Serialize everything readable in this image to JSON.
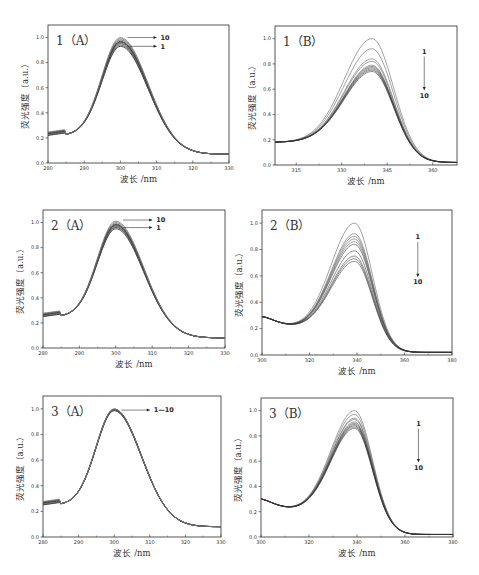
{
  "chart_data": [
    {
      "id": "1A",
      "type": "line",
      "title": "1（A）",
      "xlabel": "波长 /nm",
      "ylabel": "荧光强度（a.u.）",
      "xlim": [
        280,
        330
      ],
      "ylim": [
        0,
        1.1
      ],
      "xticks": [
        280,
        290,
        300,
        310,
        320,
        330
      ],
      "yticks": [
        0.0,
        0.2,
        0.4,
        0.6,
        0.8,
        1.0
      ],
      "peak_x": 300,
      "peaks": [
        0.93,
        0.94,
        0.95,
        0.955,
        0.96,
        0.965,
        0.97,
        0.98,
        0.99,
        1.0
      ],
      "shape": "A",
      "start_y": 0.22,
      "end_y": 0.07,
      "annotations": [
        {
          "text": "10",
          "y": 1.0
        },
        {
          "text": "1",
          "y": 0.93
        }
      ],
      "series_note": "10 curves, labeled 1 to 10",
      "box": [
        48,
        25,
        229,
        163
      ]
    },
    {
      "id": "1B",
      "type": "line",
      "title": "1（B）",
      "xlabel": "波长 /nm",
      "ylabel": "荧光强度（a.u.）",
      "xlim": [
        308,
        368
      ],
      "ylim": [
        0,
        1.1
      ],
      "xticks": [
        315,
        330,
        345,
        360
      ],
      "yticks": [
        0.0,
        0.2,
        0.4,
        0.6,
        0.8,
        1.0
      ],
      "peak_x": 340,
      "peaks": [
        1.0,
        0.92,
        0.84,
        0.82,
        0.79,
        0.78,
        0.77,
        0.76,
        0.75,
        0.74
      ],
      "shape": "B1",
      "start_y": 0.18,
      "end_y": 0.02,
      "arrow": {
        "from": "1",
        "to": "10"
      },
      "series_note": "10 curves, intensity decreases from 1 to 10",
      "box": [
        275,
        26,
        457,
        165
      ]
    },
    {
      "id": "2A",
      "type": "line",
      "title": "2（A）",
      "xlabel": "波长 /nm",
      "ylabel": "荧光强度（a.u.）",
      "xlim": [
        280,
        330
      ],
      "ylim": [
        0,
        1.1
      ],
      "xticks": [
        280,
        290,
        300,
        310,
        320,
        330
      ],
      "yticks": [
        0.0,
        0.2,
        0.4,
        0.6,
        0.8,
        1.0
      ],
      "peak_x": 300,
      "peaks": [
        0.95,
        0.96,
        0.965,
        0.97,
        0.975,
        0.98,
        0.985,
        0.99,
        1.0,
        1.01
      ],
      "shape": "A",
      "start_y": 0.25,
      "end_y": 0.08,
      "annotations": [
        {
          "text": "10",
          "y": 1.02
        },
        {
          "text": "1",
          "y": 0.96
        }
      ],
      "series_note": "10 curves, labeled 1 to 10",
      "box": [
        43,
        210,
        225,
        348
      ]
    },
    {
      "id": "2B",
      "type": "line",
      "title": "2（B）",
      "xlabel": "波长 /nm",
      "ylabel": "荧光强度（a.u.）",
      "xlim": [
        300,
        380
      ],
      "ylim": [
        0,
        1.1
      ],
      "xticks": [
        300,
        320,
        340,
        360,
        380
      ],
      "yticks": [
        0.0,
        0.2,
        0.4,
        0.6,
        0.8,
        1.0
      ],
      "peak_x": 339,
      "peaks": [
        1.0,
        0.92,
        0.9,
        0.88,
        0.86,
        0.84,
        0.79,
        0.75,
        0.73,
        0.71
      ],
      "shape": "B2",
      "start_y": 0.29,
      "end_y": 0.02,
      "arrow": {
        "from": "1",
        "to": "10"
      },
      "series_note": "10 curves, intensity decreases from 1 to 10",
      "box": [
        262,
        210,
        452,
        355
      ]
    },
    {
      "id": "3A",
      "type": "line",
      "title": "3（A）",
      "xlabel": "波长 /nm",
      "ylabel": "荧光强度（a.u.）",
      "xlim": [
        280,
        330
      ],
      "ylim": [
        0,
        1.1
      ],
      "xticks": [
        280,
        290,
        300,
        310,
        320,
        330
      ],
      "yticks": [
        0.0,
        0.2,
        0.4,
        0.6,
        0.8,
        1.0
      ],
      "peak_x": 300,
      "peaks": [
        0.985,
        0.987,
        0.989,
        0.991,
        0.993,
        0.995,
        0.996,
        0.997,
        0.998,
        0.999
      ],
      "shape": "A",
      "start_y": 0.25,
      "end_y": 0.08,
      "annotations": [
        {
          "text": "1—10",
          "y": 0.99
        }
      ],
      "series_note": "10 nearly overlapping curves",
      "box": [
        43,
        396,
        221,
        537
      ]
    },
    {
      "id": "3B",
      "type": "line",
      "title": "3（B）",
      "xlabel": "波长 /nm",
      "ylabel": "荧光强度（a.u.）",
      "xlim": [
        300,
        380
      ],
      "ylim": [
        0,
        1.1
      ],
      "xticks": [
        300,
        320,
        340,
        360,
        380
      ],
      "yticks": [
        0.0,
        0.2,
        0.4,
        0.6,
        0.8,
        1.0
      ],
      "peak_x": 339,
      "peaks": [
        1.0,
        0.97,
        0.94,
        0.93,
        0.91,
        0.9,
        0.89,
        0.88,
        0.87,
        0.86
      ],
      "shape": "B2",
      "start_y": 0.3,
      "end_y": 0.02,
      "arrow": {
        "from": "1",
        "to": "10"
      },
      "series_note": "10 curves, intensity decreases from 1 to 10",
      "box": [
        261,
        398,
        453,
        537
      ]
    }
  ]
}
